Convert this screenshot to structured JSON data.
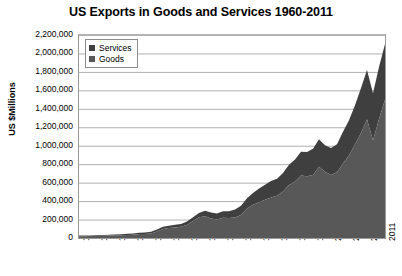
{
  "chart_data": {
    "type": "area",
    "stacked": true,
    "title": "US Exports in Goods and Services 1960-2011",
    "xlabel": "",
    "ylabel": "US $Millions",
    "ylim": [
      0,
      2200000
    ],
    "ytick_step": 200000,
    "grid": true,
    "legend_position": "top-left",
    "ytick_labels": [
      "2,200,000",
      "2,000,000",
      "1,800,000",
      "1,600,000",
      "1,400,000",
      "1,200,000",
      "1,000,000",
      "800,000",
      "600,000",
      "400,000",
      "200,000",
      "0"
    ],
    "ytick_values": [
      2200000,
      2000000,
      1800000,
      1600000,
      1400000,
      1200000,
      1000000,
      800000,
      600000,
      400000,
      200000,
      0
    ],
    "xtick_labels": [
      "1960",
      "1963",
      "1966",
      "1969",
      "1972",
      "1975",
      "1978",
      "1981",
      "1984",
      "1987",
      "1990",
      "1993",
      "1996",
      "1999",
      "2002",
      "2005",
      "2008",
      "2011"
    ],
    "x": [
      1960,
      1961,
      1962,
      1963,
      1964,
      1965,
      1966,
      1967,
      1968,
      1969,
      1970,
      1971,
      1972,
      1973,
      1974,
      1975,
      1976,
      1977,
      1978,
      1979,
      1980,
      1981,
      1982,
      1983,
      1984,
      1985,
      1986,
      1987,
      1988,
      1989,
      1990,
      1991,
      1992,
      1993,
      1994,
      1995,
      1996,
      1997,
      1998,
      1999,
      2000,
      2001,
      2002,
      2003,
      2004,
      2005,
      2006,
      2007,
      2008,
      2009,
      2010,
      2011
    ],
    "series": [
      {
        "name": "Goods",
        "color": "#585858",
        "values": [
          19650,
          20108,
          20781,
          22272,
          25501,
          26461,
          29310,
          30666,
          33626,
          36414,
          42469,
          43319,
          49381,
          71410,
          98306,
          107088,
          114745,
          120816,
          142075,
          184439,
          224250,
          237044,
          211157,
          201799,
          219926,
          215915,
          223344,
          250208,
          320230,
          359916,
          387401,
          414083,
          439631,
          456943,
          502859,
          575204,
          612113,
          678366,
          670416,
          683965,
          771994,
          718712,
          682422,
          713415,
          807516,
          894631,
          1015812,
          1138384,
          1287442,
          1056043,
          1290279,
          1497406
        ]
      },
      {
        "name": "Services",
        "color": "#3f3f3f",
        "values": [
          6290,
          6295,
          6929,
          7348,
          7840,
          8824,
          9616,
          10667,
          11917,
          12806,
          14171,
          16358,
          17841,
          19832,
          22591,
          25497,
          27971,
          31485,
          36353,
          39692,
          47584,
          57354,
          64079,
          64307,
          71168,
          73155,
          86689,
          98661,
          110919,
          127087,
          147832,
          164261,
          177251,
          185920,
          200395,
          219183,
          239489,
          256087,
          262758,
          281948,
          298646,
          286188,
          292285,
          302135,
          343681,
          380614,
          422595,
          488395,
          534097,
          512697,
          563279,
          606024
        ]
      }
    ],
    "legend": [
      {
        "label": "Services",
        "color": "#3f3f3f"
      },
      {
        "label": "Goods",
        "color": "#585858"
      }
    ]
  }
}
